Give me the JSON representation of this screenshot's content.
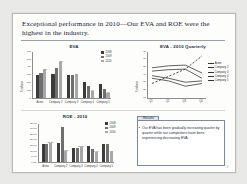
{
  "slide": {
    "title": "Exceptional performance in 2010—Our EVA and ROE were the highest in the industry.",
    "page_number": "3"
  },
  "results": {
    "tab_label": "Results",
    "bullet": "•",
    "text": "Our EVA has been gradually increasing quarter by quarter while our competitors have been experiencing decreasing EVA."
  },
  "chart_data": [
    {
      "id": "eva-bar",
      "type": "bar",
      "title": "EVA",
      "xlabel": "",
      "ylabel": "$ millions",
      "categories": [
        "Acme",
        "Company 2",
        "Company 3",
        "Company 4",
        "Company 5"
      ],
      "legend": [
        "2008",
        "2009",
        "2010"
      ],
      "legend_position": "top-right",
      "grid": false,
      "ylim": [
        0,
        600
      ],
      "yticks": [
        "600",
        "500",
        "400",
        "300",
        "200",
        "100",
        "0"
      ],
      "series": [
        {
          "name": "2008",
          "values": [
            300,
            305,
            295,
            205,
            175
          ]
        },
        {
          "name": "2009",
          "values": [
            315,
            380,
            300,
            150,
            120
          ]
        },
        {
          "name": "2010",
          "values": [
            355,
            455,
            310,
            95,
            70
          ]
        }
      ],
      "value_labels": [
        {
          "category": "Acme",
          "series": "2010",
          "text": "355"
        },
        {
          "category": "Company 2",
          "series": "2010",
          "text": "455"
        },
        {
          "category": "Company 4",
          "series": "2010",
          "text": "95"
        },
        {
          "category": "Company 5",
          "series": "2010",
          "text": "70"
        }
      ]
    },
    {
      "id": "eva-quarterly-line",
      "type": "line",
      "title": "EVA - 2010 Quarterly",
      "xlabel": "",
      "ylabel": "$ millions",
      "x": [
        "Q1",
        "Q2",
        "Q3",
        "Q4"
      ],
      "grid": false,
      "ylim": [
        0,
        70
      ],
      "yticks": [
        "70",
        "60",
        "50",
        "40",
        "30",
        "20",
        "10"
      ],
      "legend": [
        "Acme",
        "Company 2",
        "Company 3",
        "Company 4",
        "Company 5"
      ],
      "legend_position": "right",
      "series": [
        {
          "name": "Acme",
          "style": "dashed",
          "values": [
            22,
            33,
            44,
            64
          ]
        },
        {
          "name": "Company 2",
          "style": "solid",
          "values": [
            46,
            49,
            50,
            38
          ]
        },
        {
          "name": "Company 3",
          "style": "solid",
          "values": [
            41,
            43,
            44,
            30
          ]
        },
        {
          "name": "Company 4",
          "style": "solid",
          "values": [
            34,
            30,
            24,
            26
          ]
        },
        {
          "name": "Company 5",
          "style": "solid",
          "values": [
            30,
            26,
            18,
            22
          ]
        }
      ]
    },
    {
      "id": "roe-bar",
      "type": "bar",
      "title": "ROE - 2010",
      "xlabel": "",
      "ylabel": "Percent",
      "categories": [
        "Acme",
        "Company 2",
        "Company 3",
        "Company 4",
        "Company 5"
      ],
      "legend": [
        "2008",
        "2009",
        "2010"
      ],
      "legend_position": "top-right",
      "grid": false,
      "ylim": [
        0,
        35
      ],
      "yticks": [
        "35.0%",
        "30.0%",
        "25.0%",
        "20.0%",
        "15.0%",
        "10.0%",
        "5.0%",
        "0.0%"
      ],
      "series": [
        {
          "name": "2008",
          "values": [
            16.0,
            17.0,
            13.0,
            14.0,
            16.5
          ]
        },
        {
          "name": "2009",
          "values": [
            16.5,
            31.5,
            12.5,
            11.5,
            16.0
          ]
        },
        {
          "name": "2010",
          "values": [
            17.5,
            9.5,
            13.5,
            9.0,
            10.0
          ]
        }
      ],
      "value_labels": [
        {
          "category": "Acme",
          "series": "2010",
          "text": "17.5%"
        },
        {
          "category": "Company 2",
          "series": "2010",
          "text": "9.5%"
        },
        {
          "category": "Company 3",
          "series": "2010",
          "text": "13.5%"
        },
        {
          "category": "Company 4",
          "series": "2010",
          "text": "9.0%"
        }
      ]
    }
  ]
}
